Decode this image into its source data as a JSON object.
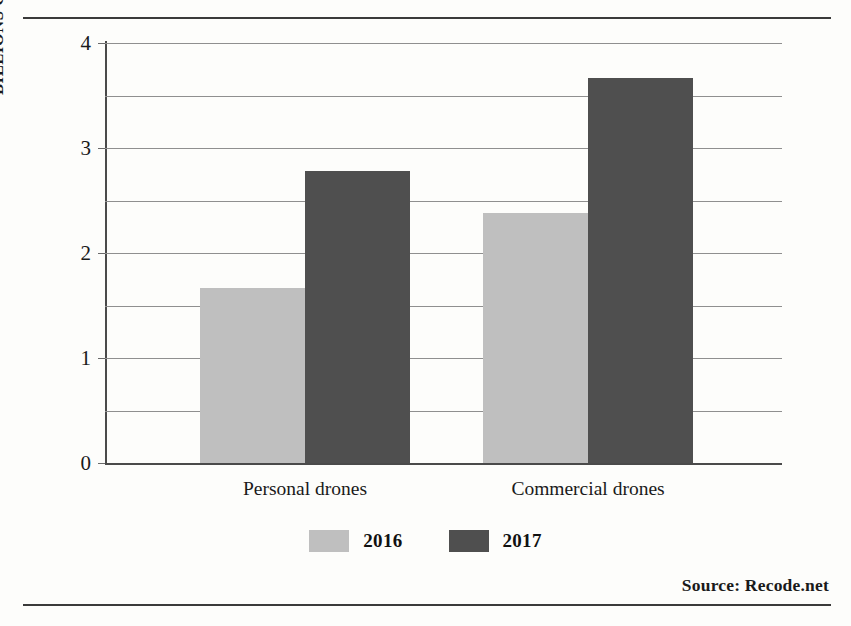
{
  "chart_data": {
    "type": "bar",
    "title": "",
    "subtitle": "",
    "xlabel": "",
    "ylabel": "BILLIONS OF DOLLARS",
    "categories": [
      "Personal drones",
      "Commercial drones"
    ],
    "series": [
      {
        "name": "2016",
        "color": "#bfbfbf",
        "values": [
          1.67,
          2.38
        ]
      },
      {
        "name": "2017",
        "color": "#4f4f4f",
        "values": [
          2.78,
          3.67
        ]
      }
    ],
    "ylim": [
      0,
      4
    ],
    "y_ticks": [
      0,
      1,
      2,
      3,
      4
    ],
    "y_tick_labels": [
      "0",
      "1",
      "2",
      "3",
      "4"
    ],
    "gridline_values": [
      0.5,
      1,
      1.5,
      2,
      2.5,
      3,
      3.5,
      4
    ],
    "grid": true,
    "legend_position": "bottom-center",
    "source": "Source:  Recode.net"
  },
  "legend": {
    "items": [
      {
        "label": "2016",
        "color": "#bfbfbf"
      },
      {
        "label": "2017",
        "color": "#4f4f4f"
      }
    ]
  },
  "footer": {
    "source_text": "Source:  Recode.net"
  },
  "colors": {
    "series_2016": "#bfbfbf",
    "series_2017": "#4f4f4f",
    "rule": "#3a3a3a",
    "gridline": "#8f8f8f",
    "text": "#1a1a1a",
    "background": "#fdfdfb"
  }
}
